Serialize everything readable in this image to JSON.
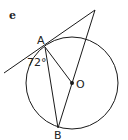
{
  "figure": {
    "part_label": "e",
    "points": {
      "A": {
        "label": "A",
        "x": 45,
        "y": 47
      },
      "B": {
        "label": "B",
        "x": 58,
        "y": 128
      },
      "O": {
        "label": "O",
        "x": 72,
        "y": 83
      },
      "T": {
        "x": 95,
        "y": 10
      }
    },
    "circle": {
      "cx": 72,
      "cy": 83,
      "r": 46
    },
    "angle_label": "72°",
    "colors": {
      "stroke": "#1a1a1a",
      "background": "#ffffff"
    }
  }
}
